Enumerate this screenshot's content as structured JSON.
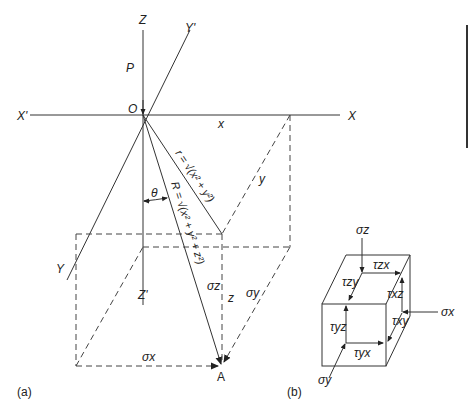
{
  "figure_a": {
    "caption": "(a)",
    "axes": {
      "z_pos": "Z",
      "z_neg": "Z'",
      "x_pos": "X",
      "x_neg": "X'",
      "y_pos": "Y",
      "y_neg": "Y'"
    },
    "origin_label": "O",
    "load_label": "P",
    "x_label": "x",
    "y_label": "y",
    "z_label": "z",
    "theta_label": "θ",
    "r_formula": "r = √(x² + y²)",
    "R_formula": "R = √(x² + y² + z²)",
    "point_label": "A",
    "stresses": {
      "sigma_x": "σx",
      "sigma_y": "σy",
      "sigma_z": "σz"
    }
  },
  "figure_b": {
    "caption": "(b)",
    "normal_stresses": {
      "sigma_z": "σz",
      "sigma_x": "σx",
      "sigma_y": "σy"
    },
    "shear_stresses": {
      "tau_zx": "τzx",
      "tau_zy": "τzy",
      "tau_xz": "τxz",
      "tau_xy": "τxy",
      "tau_yz": "τyz",
      "tau_yx": "τyx"
    }
  }
}
